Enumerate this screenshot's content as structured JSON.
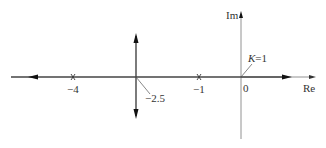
{
  "diagram": {
    "type": "root-locus",
    "axes": {
      "real_label": "Re",
      "imag_label": "Im",
      "origin_label": "0"
    },
    "poles": [
      {
        "value": -4,
        "label": "−4"
      },
      {
        "value": -1,
        "label": "−1"
      },
      {
        "value": 0,
        "label": ""
      }
    ],
    "breakaway": {
      "value": -2.5,
      "label": "−2.5"
    },
    "gain_annotation": {
      "text": "K=1",
      "k_symbol": "K",
      "rest": "=1"
    },
    "colors": {
      "line": "#555555",
      "arrow": "#111111",
      "text": "#333333"
    }
  }
}
